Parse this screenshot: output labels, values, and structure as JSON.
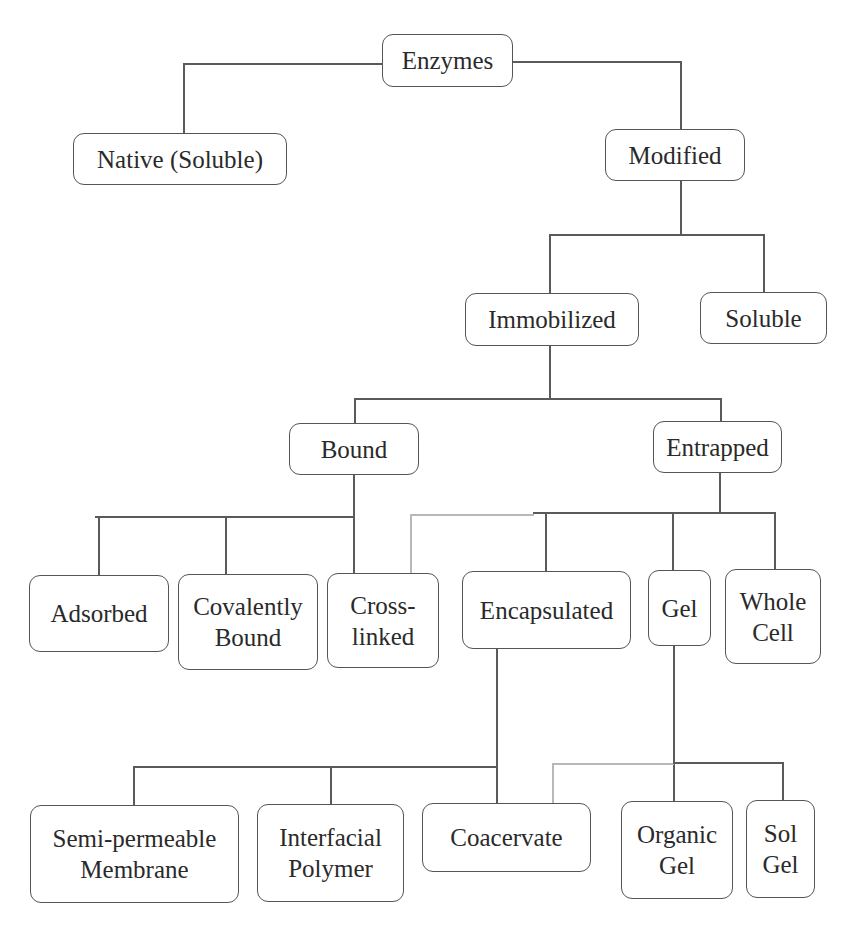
{
  "diagram": {
    "nodes": {
      "enzymes": "Enzymes",
      "native_soluble": "Native (Soluble)",
      "modified": "Modified",
      "immobilized": "Immobilized",
      "soluble": "Soluble",
      "bound": "Bound",
      "entrapped": "Entrapped",
      "adsorbed": "Adsorbed",
      "covalently_bound": "Covalently\nBound",
      "cross_linked": "Cross-\nlinked",
      "encapsulated": "Encapsulated",
      "gel": "Gel",
      "whole_cell": "Whole\nCell",
      "semi_permeable_membrane": "Semi-permeable\nMembrane",
      "interfacial_polymer": "Interfacial\nPolymer",
      "coacervate": "Coacervate",
      "organic_gel": "Organic\nGel",
      "sol_gel": "Sol\nGel"
    },
    "edges": [
      [
        "enzymes",
        "native_soluble"
      ],
      [
        "enzymes",
        "modified"
      ],
      [
        "modified",
        "immobilized"
      ],
      [
        "modified",
        "soluble"
      ],
      [
        "immobilized",
        "bound"
      ],
      [
        "immobilized",
        "entrapped"
      ],
      [
        "bound",
        "adsorbed"
      ],
      [
        "bound",
        "covalently_bound"
      ],
      [
        "bound",
        "cross_linked"
      ],
      [
        "entrapped",
        "cross_linked"
      ],
      [
        "entrapped",
        "encapsulated"
      ],
      [
        "entrapped",
        "gel"
      ],
      [
        "entrapped",
        "whole_cell"
      ],
      [
        "encapsulated",
        "semi_permeable_membrane"
      ],
      [
        "encapsulated",
        "interfacial_polymer"
      ],
      [
        "encapsulated",
        "coacervate"
      ],
      [
        "gel",
        "coacervate"
      ],
      [
        "gel",
        "organic_gel"
      ],
      [
        "gel",
        "sol_gel"
      ]
    ],
    "colors": {
      "line": "#5a5a5a",
      "light_line": "#b8b8b8",
      "border": "#555555",
      "text": "#2a2a2a"
    }
  }
}
